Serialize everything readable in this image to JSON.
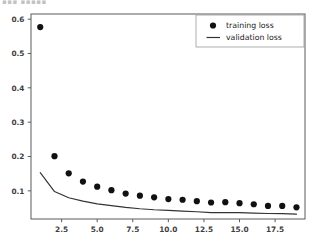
{
  "figure": {
    "top_artifact_text": "▪▪▪ ▪▪▪▪▪ ▪▪",
    "background_color": "#ffffff",
    "axis_color": "#5a5a5a"
  },
  "legend": {
    "position": "upper-right",
    "entries": [
      {
        "label": "training loss",
        "marker": "dot",
        "color": "#111111"
      },
      {
        "label": "validation loss",
        "marker": "line",
        "color": "#333333"
      }
    ]
  },
  "axes": {
    "y_ticks": [
      "0.1",
      "0.2",
      "0.3",
      "0.4",
      "0.5",
      "0.6"
    ],
    "x_ticks": [
      "2.5",
      "5.0",
      "7.5",
      "10.0",
      "12.5",
      "15.0",
      "17.5"
    ]
  },
  "chart_data": {
    "type": "scatter",
    "title": "",
    "xlabel": "",
    "ylabel": "",
    "xlim": [
      0.35,
      19.6
    ],
    "ylim": [
      0.018,
      0.615
    ],
    "grid": false,
    "legend_position": "upper right",
    "x": [
      1,
      2,
      3,
      4,
      5,
      6,
      7,
      8,
      9,
      10,
      11,
      12,
      13,
      14,
      15,
      16,
      17,
      18,
      19
    ],
    "series": [
      {
        "name": "training loss",
        "style": "markers",
        "marker": "circle",
        "color": "#111111",
        "values": [
          0.577,
          0.201,
          0.151,
          0.127,
          0.112,
          0.102,
          0.092,
          0.086,
          0.081,
          0.076,
          0.074,
          0.07,
          0.066,
          0.067,
          0.064,
          0.061,
          0.056,
          0.056,
          0.052
        ]
      },
      {
        "name": "validation loss",
        "style": "line",
        "color": "#333333",
        "values": [
          0.153,
          0.098,
          0.08,
          0.07,
          0.062,
          0.057,
          0.052,
          0.048,
          0.045,
          0.043,
          0.041,
          0.039,
          0.0365,
          0.037,
          0.0365,
          0.035,
          0.034,
          0.0335,
          0.032
        ]
      }
    ]
  }
}
